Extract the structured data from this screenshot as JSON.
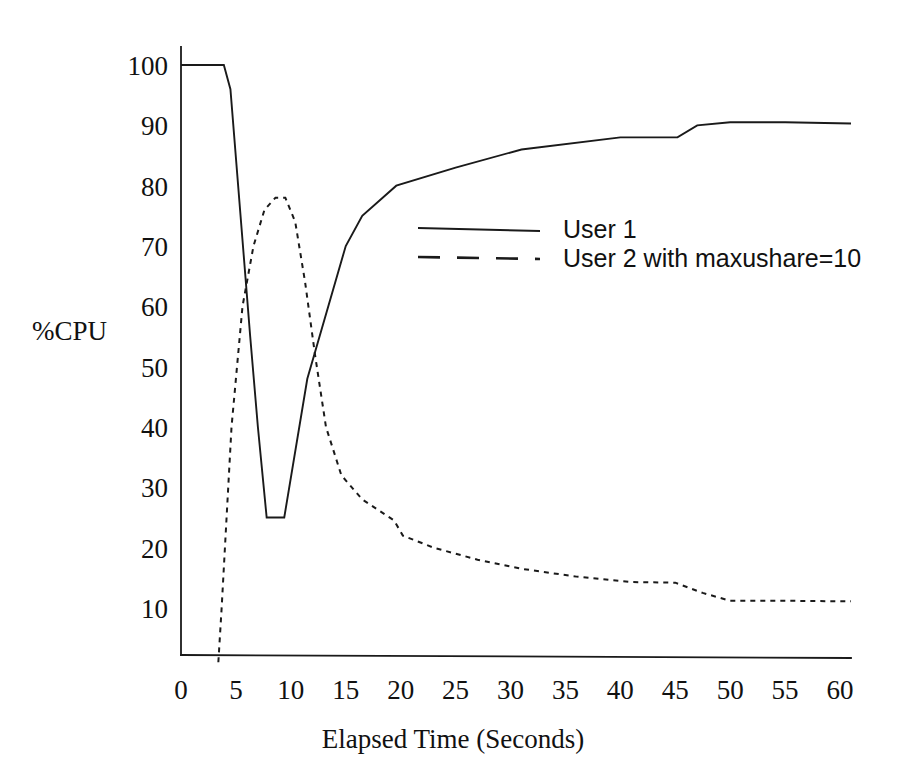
{
  "chart_data": {
    "type": "line",
    "title": "",
    "xlabel": "Elapsed Time (Seconds)",
    "ylabel": "%CPU",
    "xlim": [
      0,
      61
    ],
    "ylim": [
      0,
      103
    ],
    "grid": false,
    "legend_position": "center-right-upper",
    "x_ticks": [
      "0",
      "5",
      "10",
      "15",
      "20",
      "25",
      "30",
      "35",
      "40",
      "45",
      "50",
      "55",
      "60"
    ],
    "x_tick_values": [
      0,
      5,
      10,
      15,
      20,
      25,
      30,
      35,
      40,
      45,
      50,
      55,
      60
    ],
    "y_ticks": [
      "10",
      "20",
      "30",
      "40",
      "50",
      "60",
      "70",
      "80",
      "90",
      "100"
    ],
    "y_tick_values": [
      10,
      20,
      30,
      40,
      50,
      60,
      70,
      80,
      90,
      100
    ],
    "series": [
      {
        "name": "User 1",
        "style": "solid",
        "color": "#1a1a1a",
        "points": [
          [
            0.0,
            100
          ],
          [
            1.0,
            100
          ],
          [
            3.9,
            100
          ],
          [
            4.5,
            96
          ],
          [
            6.3,
            55
          ],
          [
            7.0,
            40
          ],
          [
            7.8,
            25
          ],
          [
            9.4,
            25
          ],
          [
            11.5,
            48
          ],
          [
            15.0,
            70
          ],
          [
            16.5,
            75
          ],
          [
            19.6,
            80
          ],
          [
            25.0,
            83
          ],
          [
            31.0,
            86
          ],
          [
            40.0,
            88
          ],
          [
            45.2,
            88
          ],
          [
            47.0,
            90
          ],
          [
            50.0,
            90.5
          ],
          [
            55.0,
            90.5
          ],
          [
            61.0,
            90.3
          ]
        ]
      },
      {
        "name": "User 2 with maxushare=10",
        "style": "dashed",
        "color": "#1a1a1a",
        "points": [
          [
            3.4,
            1
          ],
          [
            3.7,
            10
          ],
          [
            4.6,
            40
          ],
          [
            5.6,
            60
          ],
          [
            6.6,
            70
          ],
          [
            7.6,
            76
          ],
          [
            8.6,
            78
          ],
          [
            9.5,
            78
          ],
          [
            10.4,
            74
          ],
          [
            11.3,
            64
          ],
          [
            12.2,
            52
          ],
          [
            13.2,
            40
          ],
          [
            14.6,
            32
          ],
          [
            16.5,
            28
          ],
          [
            19.4,
            24.5
          ],
          [
            20.2,
            22
          ],
          [
            23.0,
            20
          ],
          [
            27.0,
            18
          ],
          [
            31.0,
            16.5
          ],
          [
            36.0,
            15.2
          ],
          [
            41.0,
            14.3
          ],
          [
            45.0,
            14.2
          ],
          [
            47.5,
            12.5
          ],
          [
            50.0,
            11.2
          ],
          [
            55.0,
            11.2
          ],
          [
            61.0,
            11.1
          ]
        ]
      }
    ],
    "legend_entries": [
      {
        "label": "User 1",
        "style": "solid"
      },
      {
        "label": "User 2 with maxushare=10",
        "style": "dashed"
      }
    ]
  }
}
